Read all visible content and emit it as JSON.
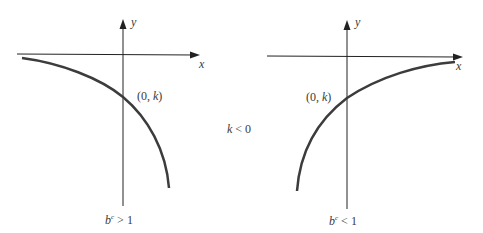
{
  "left_graph": {
    "y_axis_label": "y",
    "x_axis_label": "x",
    "intercept_label_open": "(0, ",
    "intercept_var": "k",
    "intercept_label_close": ")",
    "condition_base": "b",
    "condition_exp": "c",
    "condition_rest": " > 1"
  },
  "center": {
    "var": "k",
    "rest": " < 0"
  },
  "right_graph": {
    "y_axis_label": "y",
    "x_axis_label": "x",
    "intercept_label_open": "(0, ",
    "intercept_var": "k",
    "intercept_label_close": ")",
    "condition_base": "b",
    "condition_exp": "c",
    "condition_rest": " < 1"
  },
  "colors": {
    "axis": "#222222",
    "curve": "#3c3c3c"
  }
}
